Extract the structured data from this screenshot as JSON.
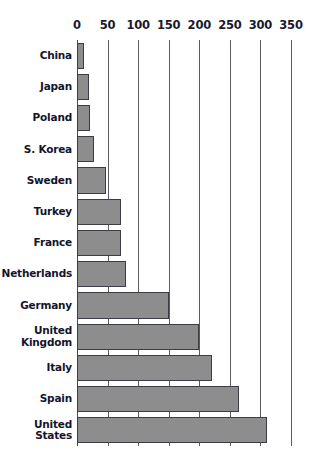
{
  "chart_data": {
    "type": "bar",
    "orientation": "horizontal",
    "title": "",
    "subtitle": "",
    "xlabel": "",
    "ylabel": "",
    "xlim": [
      0,
      350
    ],
    "grid": true,
    "legend": false,
    "xticks": [
      0,
      50,
      100,
      150,
      200,
      250,
      300,
      350
    ],
    "xtick_labels": [
      "0",
      "50",
      "100",
      "150",
      "200",
      "250",
      "300",
      "350"
    ],
    "categories": [
      "China",
      "Japan",
      "Poland",
      "S. Korea",
      "Sweden",
      "Turkey",
      "France",
      "Netherlands",
      "Germany",
      "United Kingdom",
      "Italy",
      "Spain",
      "United States"
    ],
    "category_lines": [
      [
        "China"
      ],
      [
        "Japan"
      ],
      [
        "Poland"
      ],
      [
        "S. Korea"
      ],
      [
        "Sweden"
      ],
      [
        "Turkey"
      ],
      [
        "France"
      ],
      [
        "Netherlands"
      ],
      [
        "Germany"
      ],
      [
        "United",
        "Kingdom"
      ],
      [
        "Italy"
      ],
      [
        "Spain"
      ],
      [
        "United",
        "States"
      ]
    ],
    "values": [
      12,
      20,
      21,
      28,
      48,
      72,
      72,
      80,
      150,
      200,
      220,
      265,
      310
    ],
    "colors": {
      "bar_fill": "#8d8d8d",
      "bar_stroke": "#3c3c44",
      "gridline": "#5a5a66",
      "label_text": "#14142b",
      "background": "#ffffff"
    }
  }
}
